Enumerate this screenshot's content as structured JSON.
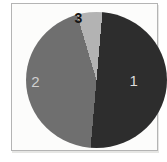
{
  "chart_data": {
    "type": "pie",
    "title": "",
    "labels": [
      "1",
      "2",
      "3"
    ],
    "values_pct": [
      50,
      44,
      6
    ],
    "start_angle_deg": 5,
    "direction": "clockwise",
    "slice_colors": [
      "#2d2d2d",
      "#6f6f6f",
      "#b3b3b3"
    ],
    "label_colors": [
      "#dcdcdc",
      "#d0d0d0",
      "#141414"
    ],
    "legend_position": "none",
    "labels_position": "inside"
  },
  "frame": {
    "background_color": "#fcfcfb",
    "border_color": "#b4b4b4"
  }
}
